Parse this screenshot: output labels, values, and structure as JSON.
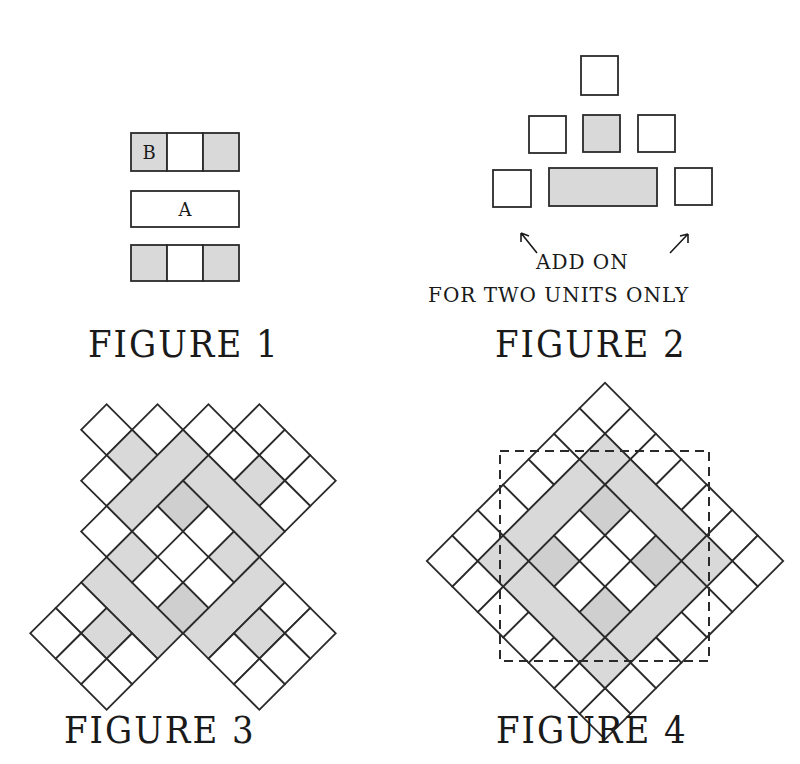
{
  "figures": [
    {
      "id": "figure-1",
      "caption": "FIGURE 1",
      "rows": [
        {
          "cells": [
            "B",
            "",
            ""
          ],
          "shading": [
            "shaded",
            "white",
            "shaded"
          ]
        },
        {
          "cells": [
            "A"
          ],
          "shading": [
            "white"
          ]
        },
        {
          "cells": [
            "",
            "",
            ""
          ],
          "shading": [
            "shaded",
            "white",
            "shaded"
          ]
        }
      ],
      "labels": {
        "b": "B",
        "a": "A"
      }
    },
    {
      "id": "figure-2",
      "caption": "FIGURE 2",
      "note_line1": "ADD ON",
      "note_line2": "FOR TWO UNITS ONLY",
      "rows": [
        {
          "shading": [
            "white"
          ]
        },
        {
          "shading": [
            "white",
            "shaded",
            "white"
          ]
        },
        {
          "shading": [
            "white",
            "shaded-bar",
            "white"
          ]
        }
      ]
    },
    {
      "id": "figure-3",
      "caption": "FIGURE 3",
      "description": "Four pieced units rotated 45 degrees around a center unit, separated by gaps"
    },
    {
      "id": "figure-4",
      "caption": "FIGURE 4",
      "description": "Assembled block on point with dashed trimming square"
    }
  ],
  "colors": {
    "shaded": "#d9d9d9",
    "line": "#2a2a2a",
    "background": "#ffffff"
  }
}
